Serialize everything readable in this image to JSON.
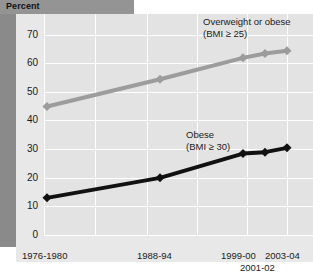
{
  "header": {
    "axis_caption": "Percent"
  },
  "chart_data": {
    "type": "line",
    "title": "",
    "subtitle": "",
    "xlabel": "",
    "ylabel": "Percent",
    "ylim": [
      0,
      75
    ],
    "yticks": [
      0,
      10,
      20,
      30,
      40,
      50,
      60,
      70
    ],
    "ytick_labels": [
      "0",
      "10",
      "20",
      "30",
      "40",
      "50",
      "60",
      "70"
    ],
    "grid": true,
    "legend_position": "inline-annotation",
    "categories": [
      "1976-1980",
      "1988-94",
      "1999-00",
      "2001-02",
      "2003-04"
    ],
    "xtick_labels": [
      "1976-1980",
      "1988-94",
      "1999-00",
      "2001-02",
      "2003-04"
    ],
    "series": [
      {
        "name": "Overweight or obese",
        "criterion": "(BMI ≥ 25)",
        "color": "#9c9c9c",
        "marker": "diamond",
        "values": [
          45,
          54.5,
          62,
          63.5,
          64.5
        ]
      },
      {
        "name": "Obese",
        "criterion": "(BMI ≥ 30)",
        "color": "#111111",
        "marker": "diamond",
        "values": [
          13,
          20,
          28.5,
          29,
          30.5
        ]
      }
    ],
    "annotations": [
      {
        "text": "Overweight or obese",
        "sub": "(BMI ≥ 25)"
      },
      {
        "text": "Obese",
        "sub": "(BMI ≥ 30)"
      }
    ]
  },
  "legend": {
    "overweight_title": "Overweight or obese",
    "overweight_criterion": "(BMI ≥ 25)",
    "obese_title": "Obese",
    "obese_criterion": "(BMI ≥ 30)"
  },
  "yaxis": {
    "t70": "70",
    "t60": "60",
    "t50": "50",
    "t40": "40",
    "t30": "30",
    "t20": "20",
    "t10": "10",
    "t0": "0"
  },
  "xaxis": {
    "l1": "1976-1980",
    "l2": "1988-94",
    "l3": "1999-00",
    "l4": "2003-04",
    "l5": "2001-02"
  },
  "colors": {
    "overweight_line": "#9c9c9c",
    "obese_line": "#111111",
    "plot_background": "#e3e3e3",
    "gridline": "#ffffff",
    "header_band": "#949494",
    "left_band": "#8a8a8a"
  }
}
